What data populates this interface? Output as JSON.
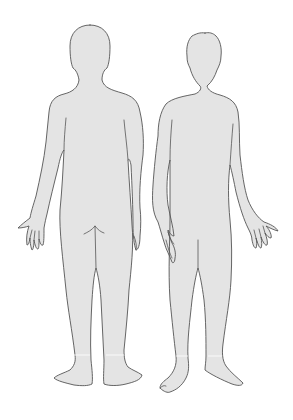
{
  "diagram": {
    "type": "body-outline-chart",
    "figures": [
      {
        "id": "back",
        "label": "Back view",
        "position": "left"
      },
      {
        "id": "front",
        "label": "Front view",
        "position": "right"
      }
    ],
    "colors": {
      "background": "#ffffff",
      "body_fill": "#e4e4e4",
      "outline": "#555555"
    }
  }
}
